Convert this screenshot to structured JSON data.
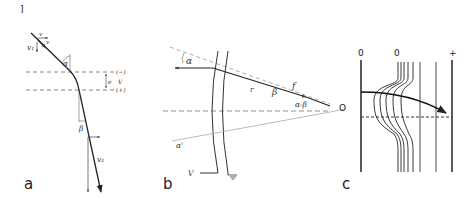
{
  "figure": {
    "bracket_mark": "]",
    "panels": [
      {
        "id": "a",
        "label": "a",
        "description": "Electron trajectory refracted while crossing a potential step between two parallel dashed planes",
        "symbols": {
          "v_incoming": "v₁",
          "v_normal_incoming": "v",
          "v_tangential_incoming": "v",
          "alpha": "α",
          "beta": "β",
          "gap": "e",
          "potential": "V",
          "upper_plane_sign": "(−)",
          "lower_plane_sign": "(+)",
          "v_outgoing": "v₂"
        }
      },
      {
        "id": "b",
        "label": "b",
        "description": "Curved grid electrode lens focusing rays toward point O",
        "symbols": {
          "alpha": "α",
          "alpha_prime": "α'",
          "beta": "β",
          "radius": "r",
          "focal": "f",
          "alpha_minus_beta": "α-β",
          "focus_point": "O",
          "voltage": "V"
        }
      },
      {
        "id": "c",
        "label": "c",
        "description": "Equipotential lines between electrodes with an electron path bending across them",
        "electrode_marks": [
          "0",
          "0",
          "+"
        ]
      }
    ]
  }
}
